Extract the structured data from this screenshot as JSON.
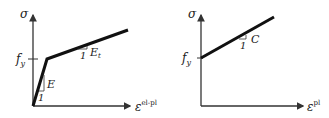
{
  "left_diagram": {
    "y_axis_label": "σ",
    "x_axis_label": "ε",
    "x_axis_superscript": "el-pl",
    "yield_label": "f",
    "yield_subscript": "y",
    "elastic_slope_label": "E",
    "elastic_slope_unit": "1",
    "hardening_slope_label": "E",
    "hardening_slope_subscript": "t",
    "hardening_slope_unit": "1"
  },
  "right_diagram": {
    "y_axis_label": "σ",
    "x_axis_label": "ε",
    "x_axis_superscript": "pl",
    "yield_label": "f",
    "yield_subscript": "y",
    "slope_label": "C",
    "slope_unit": "1"
  },
  "colors": {
    "line": "#111111",
    "axis": "#333333"
  }
}
